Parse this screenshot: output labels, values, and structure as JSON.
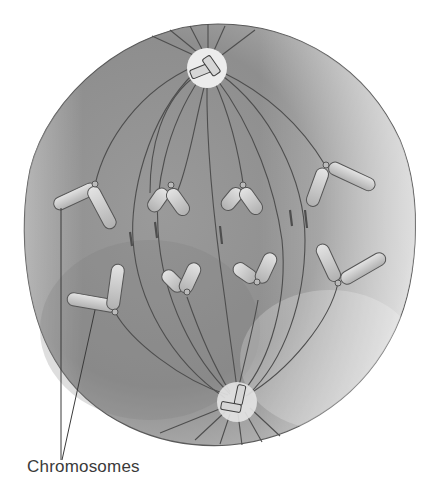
{
  "figure": {
    "labels": {
      "chromosomes": "Chromosomes"
    },
    "colors": {
      "cytoplasm_dark": "#8a8a8a",
      "cytoplasm_light": "#d9d9d9",
      "outline": "#5a5a5a",
      "chromosome_fill": "#c8c8c8",
      "centrosome_halo": "#ececec",
      "label_text": "#3a3a3a"
    },
    "structures": {
      "centrosomes": 2,
      "chromosomes_visible": 8,
      "spindle": "spindle fibers radiating from two poles"
    }
  }
}
